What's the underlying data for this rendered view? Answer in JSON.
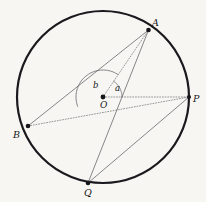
{
  "figure": {
    "kind": "circle-geometry-diagram",
    "width": 206,
    "height": 202,
    "background_color": "#f7f6f2",
    "ink_color": "#16161a",
    "thin_line_color": "#55555c",
    "dotted_line_color": "#6e6e76"
  },
  "circle": {
    "center_label": "O",
    "center_x": 103,
    "center_y": 97,
    "radius": 86,
    "stroke_width": 2.2,
    "stroke_color": "#1a1a1e"
  },
  "points": [
    {
      "id": "A",
      "label": "A",
      "x": 148.5,
      "y": 30.0,
      "label_x": 152,
      "label_y": 18,
      "dot_r": 2.3
    },
    {
      "id": "B",
      "label": "B",
      "x": 28.0,
      "y": 126.0,
      "label_x": 13,
      "label_y": 130,
      "dot_r": 2.3
    },
    {
      "id": "P",
      "label": "P",
      "x": 189.0,
      "y": 97.0,
      "label_x": 193,
      "label_y": 94,
      "dot_r": 2.0
    },
    {
      "id": "Q",
      "label": "Q",
      "x": 88.0,
      "y": 183.0,
      "label_x": 84,
      "label_y": 188,
      "dot_r": 2.3
    }
  ],
  "segments": [
    {
      "id": "AB",
      "from": "A",
      "to": "B",
      "style": "solid",
      "width": 0.7
    },
    {
      "id": "AQ",
      "from": "A",
      "to": "Q",
      "style": "solid",
      "width": 0.7
    },
    {
      "id": "QP",
      "from": "Q",
      "to": "P",
      "style": "solid",
      "width": 0.7
    },
    {
      "id": "OA",
      "from": "O",
      "to": "A",
      "style": "dotted",
      "width": 0.7
    },
    {
      "id": "OP",
      "from": "O",
      "to": "P",
      "style": "dotted",
      "width": 0.7
    },
    {
      "id": "BP",
      "from": "B",
      "to": "P",
      "style": "dotted",
      "width": 0.7
    }
  ],
  "angles": [
    {
      "id": "a",
      "label": "a",
      "vertex": "O",
      "from_ray": "P",
      "to_ray": "A",
      "arc_radius": 19,
      "label_x": 115,
      "label_y": 84,
      "description": "angle AOP at centre between radius OA and ray OP"
    },
    {
      "id": "b",
      "label": "b",
      "vertex": "O",
      "from_ray": "A",
      "to_ray": "B",
      "arc_radius": 27,
      "label_x": 93,
      "label_y": 81,
      "description": "angle AOB at centre measured over the upper-left sweep"
    }
  ]
}
